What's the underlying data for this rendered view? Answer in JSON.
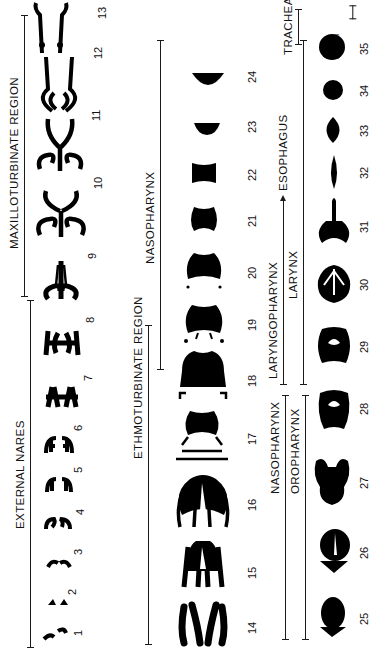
{
  "figure": {
    "orientation": "rotated 90 degrees counter-clockwise",
    "scale_bar_label": "2 mm",
    "regions": [
      {
        "id": "external_nares",
        "label": "EXTERNAL NARES",
        "sections": "1-6"
      },
      {
        "id": "maxilloturbinate",
        "label": "MAXILLOTURBINATE REGION",
        "sections": "7-13"
      },
      {
        "id": "ethmoturbinate",
        "label": "ETHMOTURBINATE REGION",
        "sections": "14-16"
      },
      {
        "id": "nasopharynx_upper",
        "label": "NASOPHARYNX",
        "sections": "17-24"
      },
      {
        "id": "nasopharynx_lower",
        "label": "NASOPHARYNX",
        "sections": "14-16"
      },
      {
        "id": "oropharynx",
        "label": "OROPHARYNX",
        "sections": "25-27"
      },
      {
        "id": "laryngopharynx",
        "label": "LARYNGOPHARYNX",
        "sections": "17-20"
      },
      {
        "id": "esophagus",
        "label": "ESOPHAGUS",
        "sections": "21-24"
      },
      {
        "id": "larynx",
        "label": "LARYNX",
        "sections": "28-34"
      },
      {
        "id": "trachea",
        "label": "TRACHEA",
        "sections": "35"
      }
    ],
    "rows": [
      {
        "row": "nasal",
        "section_numbers": [
          "1",
          "2",
          "3",
          "4",
          "5",
          "6",
          "7",
          "8",
          "9",
          "10",
          "11",
          "12",
          "13"
        ]
      },
      {
        "row": "middle",
        "section_numbers": [
          "14",
          "15",
          "16",
          "17",
          "18",
          "19",
          "20",
          "21",
          "22",
          "23",
          "24"
        ]
      },
      {
        "row": "lower",
        "section_numbers": [
          "25",
          "26",
          "27",
          "28",
          "29",
          "30",
          "31",
          "32",
          "33",
          "34",
          "35"
        ]
      }
    ]
  }
}
